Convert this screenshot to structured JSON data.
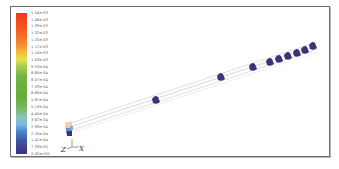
{
  "viewport": {
    "title": "",
    "colormap": {
      "colors": [
        "#f3391d",
        "#f68a2c",
        "#e4e04a",
        "#72b441",
        "#79b9e3",
        "#3f5aa6",
        "#3b2f7a"
      ],
      "labels": [
        "1.54e-03",
        "1.46e-03",
        "1.39e-03",
        "1.32e-03",
        "1.25e-03",
        "1.17e-03",
        "1.10e-03",
        "1.03e-03",
        "9.53e-04",
        "8.80e-04",
        "8.07e-04",
        "7.33e-04",
        "6.60e-04",
        "5.87e-04",
        "5.13e-04",
        "4.40e-04",
        "3.67e-04",
        "2.93e-04",
        "2.20e-04",
        "1.47e-04",
        "7.33e-05",
        "0.00e+00"
      ]
    },
    "axes": {
      "x_label": "X",
      "z_label": "Z"
    },
    "model": {
      "description": "Long diagonal pipe assembly with contoured supports",
      "support_count": 9,
      "support_color": "#3a3478"
    }
  }
}
